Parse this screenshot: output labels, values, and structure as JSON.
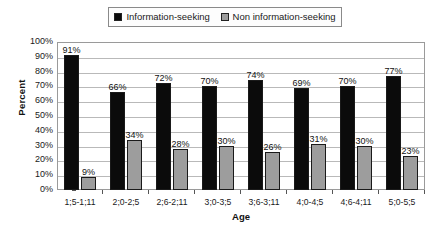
{
  "chart_data": {
    "type": "bar",
    "title": "",
    "xlabel": "Age",
    "ylabel": "Percent",
    "ylim": [
      0,
      100
    ],
    "ytick_labels": [
      "100%",
      "90%",
      "80%",
      "70%",
      "60%",
      "50%",
      "40%",
      "30%",
      "20%",
      "10%",
      "0%"
    ],
    "ytick_values": [
      100,
      90,
      80,
      70,
      60,
      50,
      40,
      30,
      20,
      10,
      0
    ],
    "grid": true,
    "legend_position": "top-center",
    "categories": [
      "1;5-1;11",
      "2;0-2;5",
      "2;6-2;11",
      "3;0-3;5",
      "3;6-3;11",
      "4;0-4;5",
      "4;6-4;11",
      "5;0-5;5"
    ],
    "series": [
      {
        "name": "Information-seeking",
        "color": "#0b0b0b",
        "values": [
          91,
          66,
          72,
          70,
          74,
          69,
          70,
          77
        ],
        "labels": [
          "91%",
          "66%",
          "72%",
          "70%",
          "74%",
          "69%",
          "70%",
          "77%"
        ]
      },
      {
        "name": "Non information-seeking",
        "color": "#9d9d9d",
        "values": [
          9,
          34,
          28,
          30,
          26,
          31,
          30,
          23
        ],
        "labels": [
          "9%",
          "34%",
          "28%",
          "30%",
          "26%",
          "31%",
          "30%",
          "23%"
        ]
      }
    ]
  },
  "legend": {
    "entries": [
      {
        "label": "Information-seeking",
        "color": "#0b0b0b"
      },
      {
        "label": "Non information-seeking",
        "color": "#9d9d9d"
      }
    ]
  }
}
